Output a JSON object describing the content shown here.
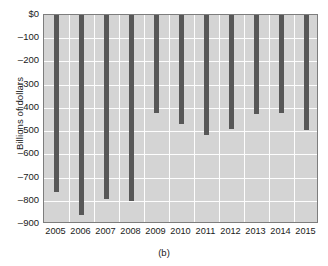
{
  "chart_data": {
    "type": "bar",
    "title": "",
    "subtitle": "",
    "caption": "(b)",
    "xlabel": "",
    "ylabel": "Billions of dollars",
    "categories": [
      "2005",
      "2006",
      "2007",
      "2008",
      "2009",
      "2010",
      "2011",
      "2012",
      "2013",
      "2014",
      "2015"
    ],
    "values": [
      -760,
      -860,
      -790,
      -800,
      -420,
      -470,
      -515,
      -490,
      -425,
      -420,
      -495
    ],
    "ylim": [
      -900,
      0
    ],
    "ytick_labels": [
      "$0",
      "–100",
      "–200",
      "–300",
      "–400",
      "–500",
      "–600",
      "–700",
      "–800",
      "–900"
    ],
    "ytick_values": [
      0,
      -100,
      -200,
      -300,
      -400,
      -500,
      -600,
      -700,
      -800,
      -900
    ],
    "grid": true,
    "legend": "none",
    "series": [
      {
        "name": "Federal budget deficit",
        "values": [
          -760,
          -860,
          -790,
          -800,
          -420,
          -470,
          -515,
          -490,
          -425,
          -420,
          -495
        ]
      }
    ],
    "colors": {
      "bar": "#575757",
      "plot_background": "#d4d4d4",
      "gridline": "#fdfdfd",
      "axis_border": "#7d7d7d",
      "text": "#1a1a1a",
      "page_background": "#ffffff"
    }
  }
}
